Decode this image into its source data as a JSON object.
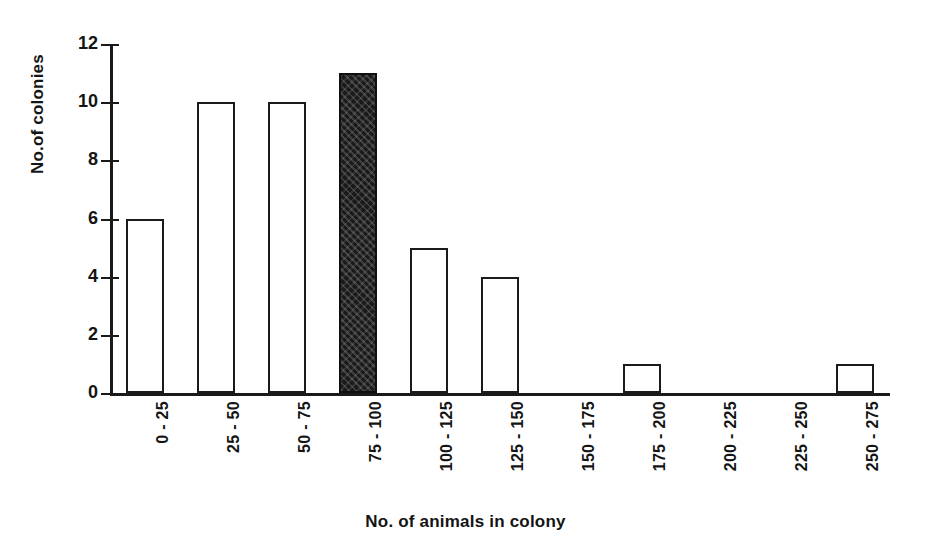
{
  "chart_data": {
    "type": "bar",
    "title": "",
    "xlabel": "No. of animals in colony",
    "ylabel": "No.of colonies",
    "categories": [
      "0 - 25",
      "25 - 50",
      "50 - 75",
      "75 - 100",
      "100 - 125",
      "125 - 150",
      "150 - 175",
      "175 - 200",
      "200 - 225",
      "225 - 250",
      "250 - 275"
    ],
    "values": [
      6,
      10,
      10,
      11,
      5,
      4,
      0,
      1,
      0,
      0,
      1
    ],
    "ylim": [
      0,
      12
    ],
    "ytick_labels": [
      "0",
      "2",
      "4",
      "6",
      "8",
      "10",
      "12"
    ],
    "ytick_values": [
      0,
      2,
      4,
      6,
      8,
      10,
      12
    ],
    "grid": false,
    "legend": null,
    "highlighted_category": "75 - 100",
    "bar_styles": [
      "outline",
      "outline",
      "outline",
      "filled",
      "outline",
      "outline",
      "outline",
      "outline",
      "outline",
      "outline",
      "outline"
    ],
    "colors": {
      "outline_stroke": "#1b1b1b",
      "outline_fill": "#ffffff",
      "filled": "#1a1a1a",
      "axis": "#1a1a1a",
      "text": "#141414",
      "background": "#ffffff"
    }
  }
}
